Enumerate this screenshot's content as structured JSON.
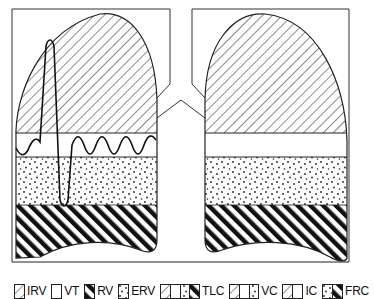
{
  "diagram": {
    "colors": {
      "stroke": "#1a1a1a",
      "background": "#ffffff"
    },
    "regions": [
      {
        "id": "IRV",
        "pattern": "light-diagonal-hatch",
        "lung_side": "both"
      },
      {
        "id": "VT",
        "pattern": "blank",
        "lung_side": "both"
      },
      {
        "id": "ERV",
        "pattern": "stipple-dots",
        "lung_side": "both"
      },
      {
        "id": "RV",
        "pattern": "bold-diagonal-hatch",
        "lung_side": "both"
      }
    ],
    "trace": {
      "description": "spirometer tracing with tidal waves and one maximal inspiration/expiration",
      "lung_side": "left"
    }
  },
  "legend": {
    "items": [
      {
        "label": "IRV",
        "swatches": [
          "light-hatch"
        ]
      },
      {
        "label": "VT",
        "swatches": [
          "blank"
        ]
      },
      {
        "label": "RV",
        "swatches": [
          "bold-hatch"
        ]
      },
      {
        "label": "ERV",
        "swatches": [
          "dots"
        ]
      },
      {
        "label": "TLC",
        "swatches": [
          "light-hatch",
          "blank",
          "dots",
          "bold-hatch"
        ]
      },
      {
        "label": "VC",
        "swatches": [
          "light-hatch",
          "blank",
          "dots"
        ]
      },
      {
        "label": "IC",
        "swatches": [
          "light-hatch",
          "blank"
        ]
      },
      {
        "label": "FRC",
        "swatches": [
          "dots",
          "bold-hatch"
        ]
      }
    ]
  }
}
